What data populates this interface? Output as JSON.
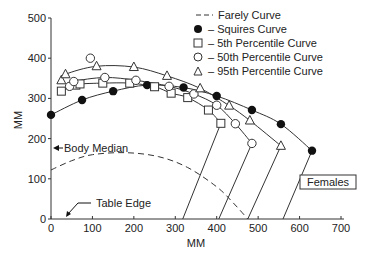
{
  "chart_data": {
    "type": "scatter",
    "title": "",
    "xlabel": "MM",
    "ylabel": "MM",
    "xlim": [
      0,
      700
    ],
    "ylim": [
      0,
      500
    ],
    "x_ticks": [
      0,
      100,
      200,
      300,
      400,
      500,
      600,
      700
    ],
    "y_ticks": [
      0,
      100,
      200,
      300,
      400,
      500
    ],
    "grid": false,
    "legend_position": "top-right",
    "legend": [
      {
        "marker": "dashed-line",
        "label": "Farely Curve"
      },
      {
        "marker": "filled-circle",
        "label": "– Squires Curve"
      },
      {
        "marker": "open-square",
        "label": "– 5th Percentile Curve"
      },
      {
        "marker": "open-circle",
        "label": "– 50th Percentile Curve"
      },
      {
        "marker": "open-triangle",
        "label": "– 95th Percentile Curve"
      }
    ],
    "series": [
      {
        "name": "Squires Curve",
        "marker": "filled-circle",
        "points": [
          [
            0,
            259
          ],
          [
            75,
            296
          ],
          [
            150,
            318
          ],
          [
            232,
            333
          ],
          [
            320,
            327
          ],
          [
            400,
            306
          ],
          [
            485,
            271
          ],
          [
            555,
            236
          ],
          [
            630,
            170
          ]
        ],
        "drop_line": [
          [
            630,
            170
          ],
          [
            560,
            0
          ]
        ]
      },
      {
        "name": "5th Percentile Curve",
        "marker": "open-square",
        "points": [
          [
            25,
            318
          ],
          [
            60,
            333
          ],
          [
            70,
            336
          ],
          [
            125,
            338
          ],
          [
            190,
            338
          ],
          [
            250,
            329
          ],
          [
            290,
            313
          ],
          [
            330,
            302
          ],
          [
            380,
            271
          ],
          [
            410,
            238
          ]
        ],
        "drop_line": [
          [
            410,
            238
          ],
          [
            318,
            0
          ]
        ]
      },
      {
        "name": "50th Percentile Curve",
        "marker": "open-circle",
        "points": [
          [
            45,
            330
          ],
          [
            55,
            342
          ],
          [
            95,
            400
          ],
          [
            130,
            352
          ],
          [
            205,
            345
          ],
          [
            285,
            330
          ],
          [
            345,
            311
          ],
          [
            400,
            283
          ],
          [
            445,
            237
          ],
          [
            485,
            188
          ]
        ],
        "drop_line": [
          [
            485,
            188
          ],
          [
            405,
            0
          ]
        ]
      },
      {
        "name": "95th Percentile Curve",
        "marker": "open-triangle",
        "points": [
          [
            25,
            345
          ],
          [
            35,
            360
          ],
          [
            110,
            380
          ],
          [
            200,
            378
          ],
          [
            280,
            356
          ],
          [
            360,
            325
          ],
          [
            430,
            282
          ],
          [
            480,
            245
          ],
          [
            555,
            182
          ]
        ],
        "drop_line": [
          [
            555,
            182
          ],
          [
            475,
            0
          ]
        ]
      },
      {
        "name": "Farely Curve",
        "marker": "dashed-line",
        "points": [
          [
            0,
            122
          ],
          [
            50,
            145
          ],
          [
            100,
            160
          ],
          [
            180,
            165
          ],
          [
            260,
            155
          ],
          [
            330,
            128
          ],
          [
            400,
            80
          ],
          [
            440,
            40
          ],
          [
            475,
            0
          ]
        ]
      }
    ],
    "annotations": [
      {
        "text": "Body Median",
        "arrow_to": [
          0,
          180
        ]
      },
      {
        "text": "Table Edge",
        "arrow_to": [
          35,
          0
        ]
      },
      {
        "text": "Females",
        "boxed": true
      }
    ]
  },
  "labels": {
    "xlabel": "MM",
    "ylabel": "MM",
    "x_ticks": [
      "0",
      "100",
      "200",
      "300",
      "400",
      "500",
      "600",
      "700"
    ],
    "y_ticks": [
      "0",
      "100",
      "200",
      "300",
      "400",
      "500"
    ],
    "legend": [
      "Farely Curve",
      "– Squires Curve",
      "– 5th Percentile Curve",
      "– 50th Percentile Curve",
      "– 95th Percentile Curve"
    ],
    "body_median": "Body Median",
    "table_edge": "Table Edge",
    "females": "Females"
  }
}
